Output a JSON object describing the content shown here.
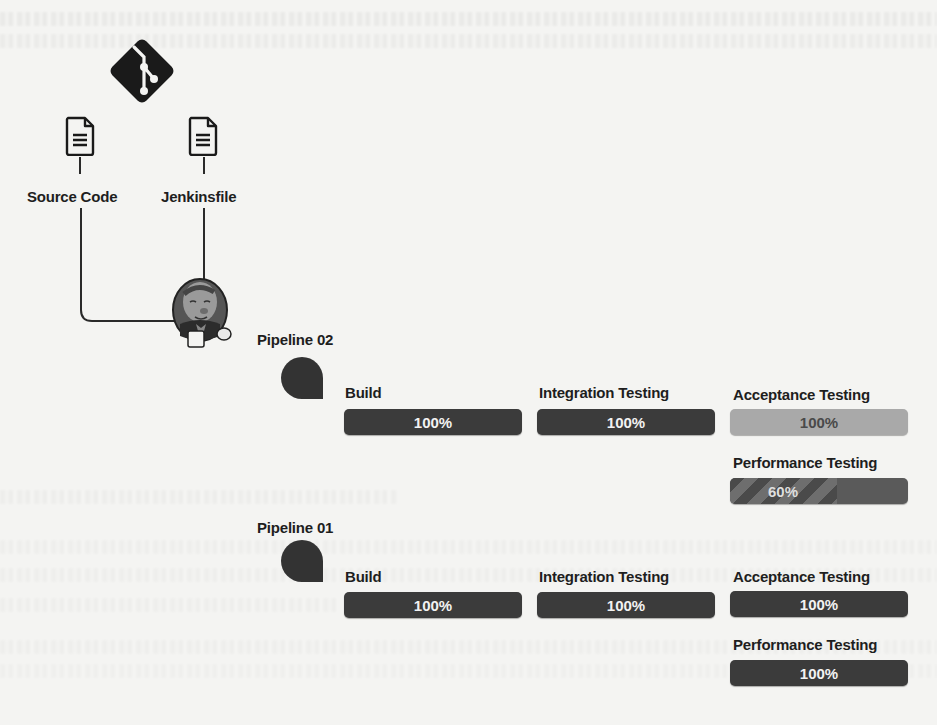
{
  "diagram": {
    "title_nodes": {
      "git_icon": "git-logo",
      "source_code": "Source Code",
      "jenkinsfile": "Jenkinsfile",
      "jenkins": "jenkins-butler-logo"
    },
    "pipelines": [
      {
        "name": "Pipeline 02",
        "stages": [
          {
            "label": "Build",
            "progress": "100%",
            "state": "complete"
          },
          {
            "label": "Integration Testing",
            "progress": "100%",
            "state": "complete"
          },
          {
            "label": "Acceptance Testing",
            "progress": "100%",
            "state": "complete-light"
          },
          {
            "label": "Performance Testing",
            "progress": "60%",
            "state": "in-progress",
            "percent": 60
          }
        ]
      },
      {
        "name": "Pipeline 01",
        "stages": [
          {
            "label": "Build",
            "progress": "100%",
            "state": "complete"
          },
          {
            "label": "Integration Testing",
            "progress": "100%",
            "state": "complete"
          },
          {
            "label": "Acceptance Testing",
            "progress": "100%",
            "state": "complete"
          },
          {
            "label": "Performance Testing",
            "progress": "100%",
            "state": "complete"
          }
        ]
      }
    ]
  },
  "colors": {
    "bar_dark": "#3b3b3b",
    "bar_light": "#a9a9a9",
    "bar_progress": "#5a5a5a",
    "background": "#f4f4f2"
  }
}
